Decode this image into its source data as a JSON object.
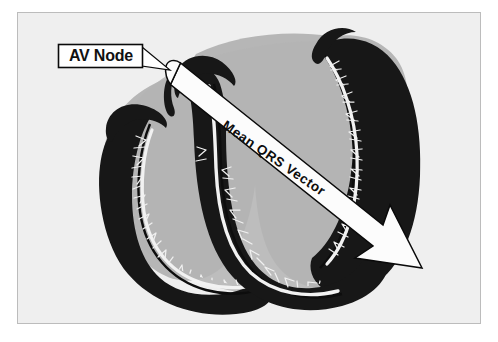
{
  "figure": {
    "type": "anatomical-diagram",
    "background_color": "#efefef",
    "border_color": "#b9b9b9",
    "page_color": "#ffffff"
  },
  "labels": {
    "av_node": "AV Node",
    "mean_qrs_vector": "Mean  QRS  Vector"
  },
  "colors": {
    "chamber_gray": "#b4b4b4",
    "chamber_gray_light": "#bdbdbd",
    "myocardium_black": "#171717",
    "purkinje_white": "#f4f4f4",
    "outline_black": "#000000",
    "callout_fill": "#ffffff",
    "arrow_fill": "#fbfbfb",
    "background": "#efefef"
  },
  "anatomy": {
    "parts": [
      "right-atrium",
      "left-atrium",
      "right-ventricle",
      "left-ventricle",
      "interventricular-septum",
      "purkinje-fibers",
      "av-node",
      "bundle-of-his"
    ]
  },
  "markers": {
    "av_node_point": {
      "x": 176,
      "y": 73,
      "r": 7
    },
    "vector_start": {
      "x": 180,
      "y": 76
    },
    "vector_tip": {
      "x": 420,
      "y": 268
    },
    "vector_angle_deg": 38.7
  }
}
